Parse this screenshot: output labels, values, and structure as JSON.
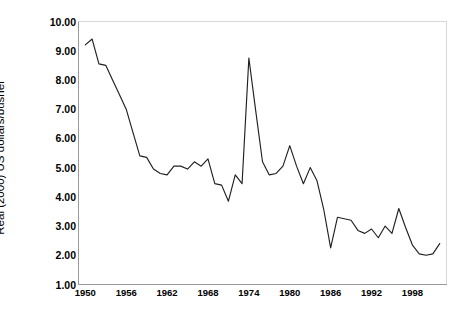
{
  "chart_data": {
    "type": "line",
    "title": "",
    "subtitle": "",
    "xlabel": "",
    "ylabel": "Real (2000) US dollars/bushel",
    "xlim": [
      1949,
      2003
    ],
    "ylim": [
      1.0,
      10.0
    ],
    "grid": false,
    "legend": false,
    "legend_position": "none",
    "y_ticks": [
      "1.00",
      "2.00",
      "3.00",
      "4.00",
      "5.00",
      "6.00",
      "7.00",
      "8.00",
      "9.00",
      "10.00"
    ],
    "y_tick_values": [
      1,
      2,
      3,
      4,
      5,
      6,
      7,
      8,
      9,
      10
    ],
    "x_ticks": [
      "1950",
      "1956",
      "1962",
      "1968",
      "1974",
      "1980",
      "1986",
      "1992",
      "1998"
    ],
    "x_tick_values": [
      1950,
      1956,
      1962,
      1968,
      1974,
      1980,
      1986,
      1992,
      1998
    ],
    "line_color": "#231f20",
    "axis_color": "#9a9a9a",
    "border_color": "#d9d9d9",
    "series": [
      {
        "name": "Real wheat price",
        "x": [
          1950,
          1951,
          1952,
          1953,
          1954,
          1955,
          1956,
          1957,
          1958,
          1959,
          1960,
          1961,
          1962,
          1963,
          1964,
          1965,
          1966,
          1967,
          1968,
          1969,
          1970,
          1971,
          1972,
          1973,
          1974,
          1975,
          1976,
          1977,
          1978,
          1979,
          1980,
          1981,
          1982,
          1983,
          1984,
          1985,
          1986,
          1987,
          1988,
          1989,
          1990,
          1991,
          1992,
          1993,
          1994,
          1995,
          1996,
          1997,
          1998,
          1999,
          2000,
          2001,
          2002
        ],
        "values": [
          9.2,
          9.4,
          8.55,
          8.5,
          8.0,
          7.5,
          7.0,
          6.2,
          5.4,
          5.35,
          4.95,
          4.8,
          4.75,
          5.05,
          5.05,
          4.95,
          5.2,
          5.05,
          5.3,
          4.45,
          4.4,
          3.85,
          4.75,
          4.45,
          8.75,
          6.95,
          5.2,
          4.75,
          4.8,
          5.05,
          5.75,
          5.05,
          4.45,
          5.0,
          4.55,
          3.55,
          2.25,
          3.3,
          3.25,
          3.2,
          2.85,
          2.75,
          2.9,
          2.6,
          3.0,
          2.75,
          3.6,
          2.95,
          2.35,
          2.05,
          2.0,
          2.05,
          2.4
        ]
      }
    ]
  },
  "axes": {
    "y_title": "Real (2000) US dollars/bushel"
  }
}
